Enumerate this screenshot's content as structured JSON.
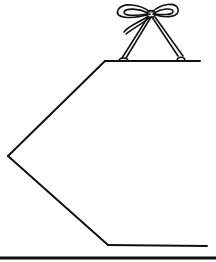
{
  "illustration": {
    "subject": "gift tag outline with ribbon bow",
    "elements": [
      "ribbon-bow",
      "tag-outline",
      "baseline-rule"
    ],
    "colors": {
      "background": "#ffffff",
      "ink": "#111111"
    }
  }
}
